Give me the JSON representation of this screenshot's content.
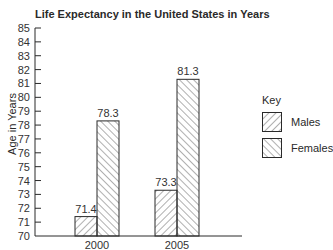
{
  "chart_data": {
    "type": "bar",
    "title": "Life Expectancy in the United States in Years",
    "xlabel": "",
    "ylabel": "Age in Years",
    "categories": [
      "2000",
      "2005"
    ],
    "series": [
      {
        "name": "Males",
        "values": [
          71.4,
          73.3
        ],
        "pattern": "hatch-forward"
      },
      {
        "name": "Females",
        "values": [
          78.3,
          81.3
        ],
        "pattern": "hatch-backward"
      }
    ],
    "data_labels": {
      "Males": [
        "71.4",
        "73.3"
      ],
      "Females": [
        "78.3",
        "81.3"
      ]
    },
    "ylim": [
      70,
      85
    ],
    "yticks": [
      70,
      71,
      72,
      73,
      74,
      75,
      76,
      77,
      78,
      79,
      80,
      81,
      82,
      83,
      84,
      85
    ],
    "grid": false,
    "legend": {
      "title": "Key",
      "position": "right",
      "entries": [
        "Males",
        "Females"
      ]
    }
  },
  "colors": {
    "stroke": "#2a2a2a",
    "background": "#ffffff"
  }
}
